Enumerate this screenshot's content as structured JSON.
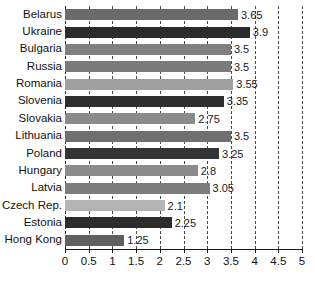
{
  "chart_data": {
    "type": "bar",
    "orientation": "horizontal",
    "title": "",
    "subtitle": "",
    "xlabel": "",
    "ylabel": "",
    "xlim": [
      0,
      5
    ],
    "xticks": [
      "0",
      "0.5",
      "1",
      "1.5",
      "2",
      "2.5",
      "3",
      "3.5",
      "4",
      "4.5",
      "5"
    ],
    "xtick_values": [
      0,
      0.5,
      1,
      1.5,
      2,
      2.5,
      3,
      3.5,
      4,
      4.5,
      5
    ],
    "grid": "vertical-dashed",
    "legend": "none",
    "categories": [
      "Belarus",
      "Ukraine",
      "Bulgaria",
      "Russia",
      "Romania",
      "Slovenia",
      "Slovakia",
      "Lithuania",
      "Poland",
      "Hungary",
      "Latvia",
      "Czech Rep.",
      "Estonia",
      "Hong Kong"
    ],
    "values": [
      3.65,
      3.9,
      3.5,
      3.5,
      3.55,
      3.35,
      2.75,
      3.5,
      3.25,
      2.8,
      3.05,
      2.1,
      2.25,
      1.25
    ],
    "value_labels": [
      "3.65",
      "3.9",
      "3.5",
      "3.5",
      "3.55",
      "3.35",
      "2.75",
      "3.5",
      "3.25",
      "2.8",
      "3.05",
      "2.1",
      "2.25",
      "1.25"
    ],
    "bar_colors": [
      "#6b6b6b",
      "#2b2b2b",
      "#808080",
      "#7a7a7a",
      "#a0a0a0",
      "#2e2e2e",
      "#8a8a8a",
      "#6f6f6f",
      "#343434",
      "#8c8c8c",
      "#7d7d7d",
      "#b5b5b5",
      "#2c2c2c",
      "#606060"
    ]
  },
  "axis": {
    "gridline_color": "#4a4a4a",
    "axis_color": "#1a1a1a",
    "background": "#ffffff"
  }
}
